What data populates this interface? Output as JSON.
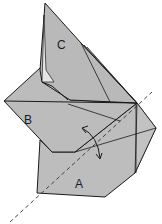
{
  "diagram": {
    "type": "folding-instruction",
    "panels": [
      {
        "id": "A",
        "label": "A"
      },
      {
        "id": "B",
        "label": "B"
      },
      {
        "id": "C",
        "label": "C"
      }
    ],
    "fold_axis": {
      "style": "dashed"
    },
    "arrow": {
      "type": "curved-double-headed",
      "meaning": "fold/rotate"
    },
    "colors": {
      "panel_fill": "#b8b8b8",
      "panel_fill_light": "#c6c6c6",
      "edge": "#1a1a1a",
      "inner_light": "#e8e8e8",
      "background": "#ffffff"
    }
  }
}
